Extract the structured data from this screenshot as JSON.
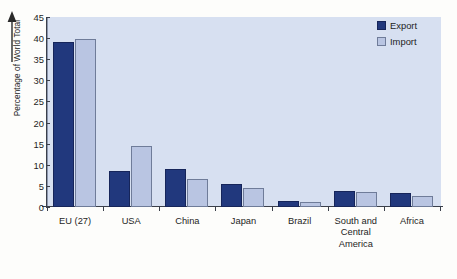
{
  "chart_data": {
    "type": "bar",
    "title": "",
    "subtitle": "",
    "xlabel": "",
    "ylabel": "Percentage of World Total",
    "ylim": [
      0,
      45
    ],
    "yticks": [
      45,
      40,
      35,
      30,
      25,
      20,
      15,
      10,
      5,
      0
    ],
    "grid": false,
    "legend_position": "top-right",
    "categories": [
      "EU (27)",
      "USA",
      "China",
      "Japan",
      "Brazil",
      "South and\nCentral\nAmerica",
      "Africa"
    ],
    "series": [
      {
        "name": "Export",
        "color": "#21387d",
        "values": [
          39.1,
          8.5,
          9.0,
          5.5,
          1.5,
          3.8,
          3.3
        ]
      },
      {
        "name": "Import",
        "color": "#b9c5e2",
        "values": [
          39.8,
          14.5,
          6.7,
          4.6,
          1.1,
          3.5,
          2.6
        ]
      }
    ]
  },
  "legend": {
    "items": [
      {
        "label": "Export",
        "swatch": "export-swatch"
      },
      {
        "label": "Import",
        "swatch": "import-swatch"
      }
    ]
  },
  "axis": {
    "y_title": "Percentage of World Total",
    "arrow_icon": "up-arrow-icon"
  },
  "caption": {
    "text": ""
  },
  "colors": {
    "plot_background": "#d7e0f1",
    "export_bar": "#21387d",
    "import_bar": "#b9c5e2",
    "axis": "#3a3f4a",
    "page_background": "#fdfdfb"
  }
}
